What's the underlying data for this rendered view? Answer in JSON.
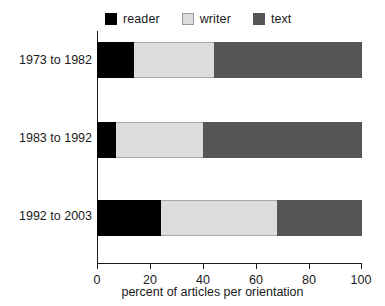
{
  "chart_data": {
    "type": "bar",
    "orientation": "horizontal",
    "stacked": true,
    "title": "",
    "xlabel": "percent of articles per orientation",
    "ylabel": "",
    "xlim": [
      0,
      100
    ],
    "xticks": [
      0,
      20,
      40,
      60,
      80,
      100
    ],
    "xtick_labels": [
      "0",
      "20",
      "40",
      "60",
      "80",
      "100"
    ],
    "grid": false,
    "legend_position": "top",
    "categories": [
      "1973 to 1982",
      "1983 to 1992",
      "1992 to 2003"
    ],
    "series": [
      {
        "name": "reader",
        "color": "#000000",
        "values": [
          14,
          7,
          24
        ]
      },
      {
        "name": "writer",
        "color": "#dcdcdc",
        "values": [
          30,
          33,
          44
        ]
      },
      {
        "name": "text",
        "color": "#555555",
        "values": [
          56,
          60,
          32
        ]
      }
    ],
    "cumulative_boundaries": [
      [
        14,
        44,
        100
      ],
      [
        7,
        40,
        100
      ],
      [
        24,
        68,
        100
      ]
    ]
  },
  "legend": {
    "items": [
      {
        "label": "reader",
        "swatch": "reader-swatch"
      },
      {
        "label": "writer",
        "swatch": "writer-swatch"
      },
      {
        "label": "text",
        "swatch": "text-swatch"
      }
    ]
  },
  "axis": {
    "x_title": "percent of articles per orientation",
    "ticks": [
      "0",
      "20",
      "40",
      "60",
      "80",
      "100"
    ]
  },
  "categories": [
    "1973 to 1982",
    "1983 to 1992",
    "1992 to 2003"
  ]
}
